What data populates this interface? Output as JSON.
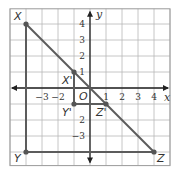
{
  "figure": {
    "colors": {
      "grid": "#b8b8b8",
      "border": "#9a9a9a",
      "axis": "#222222",
      "segment": "#5c5c5c",
      "point": "#555555",
      "label": "#333333"
    },
    "grid": {
      "x_min": -5,
      "x_max": 5,
      "y_min": -5,
      "y_max": 5
    },
    "axes": {
      "x_label": "x",
      "y_label": "y",
      "origin_label": "O",
      "x_ticks": [
        {
          "value": -3,
          "label": "−3"
        },
        {
          "value": -2,
          "label": "−2"
        },
        {
          "value": 1,
          "label": "1"
        },
        {
          "value": 2,
          "label": "2"
        },
        {
          "value": 3,
          "label": "3"
        },
        {
          "value": 4,
          "label": "4"
        }
      ],
      "y_ticks": [
        {
          "value": 4,
          "label": "4"
        },
        {
          "value": 3,
          "label": "3"
        },
        {
          "value": 2,
          "label": "2"
        },
        {
          "value": 1,
          "label": "1"
        },
        {
          "value": -2,
          "label": "2"
        },
        {
          "value": -3,
          "label": "−3"
        }
      ]
    },
    "points": [
      {
        "name": "X",
        "x": -4,
        "y": 4
      },
      {
        "name": "Y",
        "x": -4,
        "y": -4
      },
      {
        "name": "Z",
        "x": 4,
        "y": -4
      },
      {
        "name": "X'",
        "x": -1,
        "y": 1
      },
      {
        "name": "Y'",
        "x": -1,
        "y": -1
      },
      {
        "name": "Z'",
        "x": 1,
        "y": -1
      }
    ],
    "segments": [
      {
        "from": "X",
        "to": "Y"
      },
      {
        "from": "Y",
        "to": "Z"
      },
      {
        "from": "X",
        "to": "Z"
      },
      {
        "from": "X'",
        "to": "Y'"
      },
      {
        "from": "Y'",
        "to": "Z'"
      }
    ],
    "labels": {
      "X": "X",
      "Y": "Y",
      "Z": "Z",
      "Xp": "X'",
      "Yp": "Y'",
      "Zp": "Z'"
    }
  }
}
